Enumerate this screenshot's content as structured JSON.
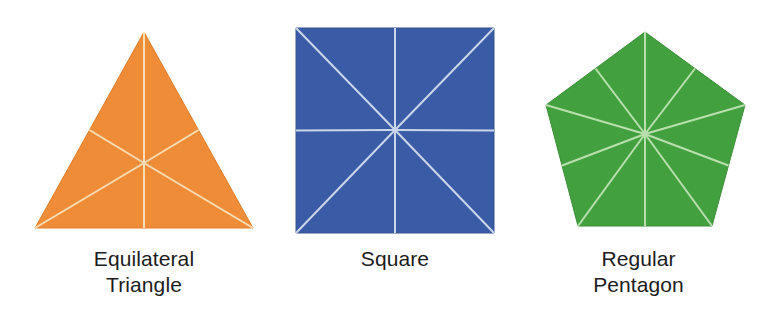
{
  "figure": {
    "background_color": "#ffffff",
    "divider_color": "#f7ead9",
    "caption_color": "#1c1c1c"
  },
  "shapes": [
    {
      "id": "equilateral-triangle",
      "name": "Equilateral Triangle",
      "caption_line1": "Equilateral",
      "caption_line2": "Triangle",
      "caption": "Equilateral\nTriangle",
      "sides": 3,
      "fill_color": "#ee8c38",
      "edge_color": "#e07f2c",
      "divider_color": "#f8dcb4",
      "wedge_count": 6,
      "center": {
        "x": 144,
        "y": 163
      },
      "vertices": [
        {
          "x": 144,
          "y": 32
        },
        {
          "x": 253,
          "y": 228
        },
        {
          "x": 35,
          "y": 228
        }
      ]
    },
    {
      "id": "square",
      "name": "Square",
      "caption_line1": "Square",
      "caption_line2": "",
      "caption": "Square",
      "sides": 4,
      "fill_color": "#3a5ca6",
      "edge_color": "#33528f",
      "divider_color": "#ccd6ea",
      "wedge_count": 8,
      "center": {
        "x": 395,
        "y": 130
      },
      "vertices": [
        {
          "x": 296,
          "y": 28
        },
        {
          "x": 494,
          "y": 28
        },
        {
          "x": 494,
          "y": 233
        },
        {
          "x": 296,
          "y": 233
        }
      ]
    },
    {
      "id": "regular-pentagon",
      "name": "Regular Pentagon",
      "caption_line1": "Regular",
      "caption_line2": "Pentagon",
      "caption": "Regular\nPentagon",
      "sides": 5,
      "fill_color": "#43a03f",
      "edge_color": "#3a9036",
      "divider_color": "#b9dfae",
      "wedge_count": 10,
      "center": {
        "x": 645,
        "y": 134
      },
      "vertices": [
        {
          "x": 645,
          "y": 32
        },
        {
          "x": 745,
          "y": 105
        },
        {
          "x": 712,
          "y": 226
        },
        {
          "x": 578,
          "y": 226
        },
        {
          "x": 546,
          "y": 105
        }
      ]
    }
  ]
}
